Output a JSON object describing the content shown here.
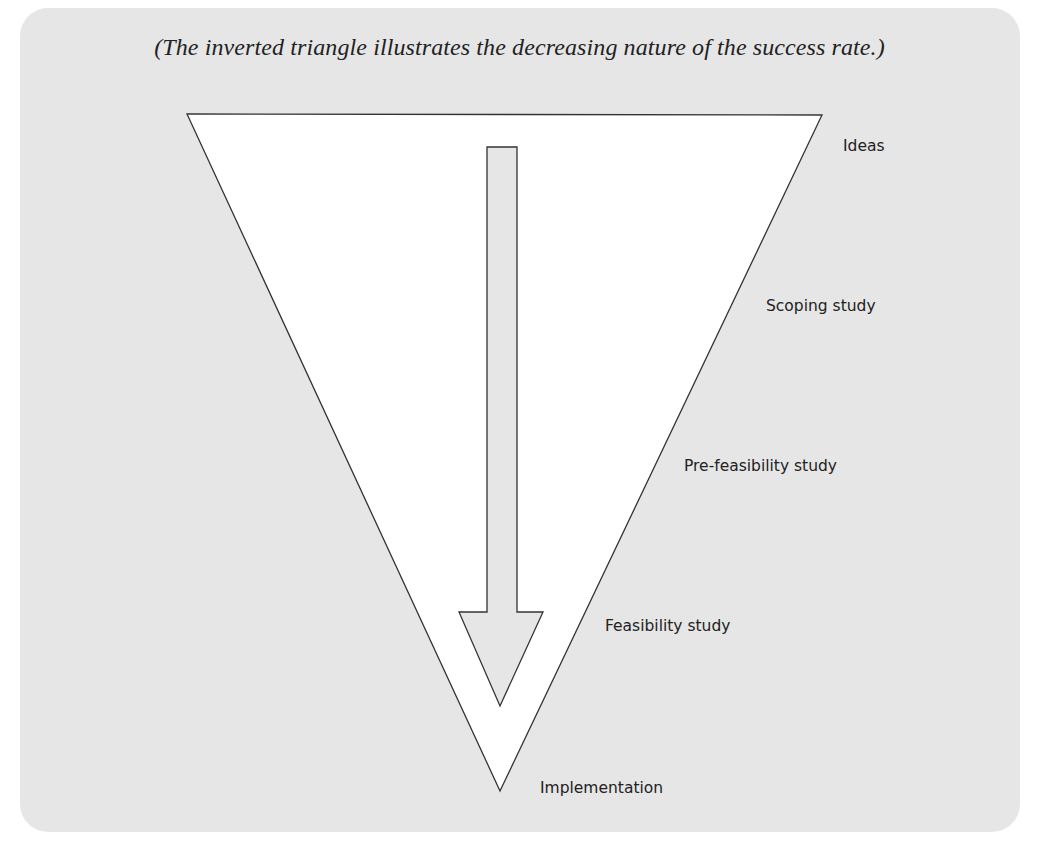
{
  "caption": "(The inverted triangle illustrates the decreasing nature of the success rate.)",
  "stages": [
    {
      "label": "Ideas"
    },
    {
      "label": "Scoping study"
    },
    {
      "label": "Pre-feasibility study"
    },
    {
      "label": "Feasibility study"
    },
    {
      "label": "Implementation"
    }
  ],
  "colors": {
    "background_panel": "#e6e6e6",
    "triangle_fill": "#ffffff",
    "arrow_fill": "#e6e6e6",
    "stroke": "#333333",
    "text": "#222222"
  }
}
